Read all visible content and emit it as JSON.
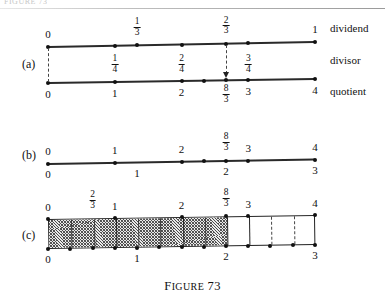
{
  "figure": {
    "running_head": "FIGURE 73",
    "caption_word": "F",
    "caption_word_rest": "IGURE",
    "caption_number": "73",
    "caption_full": "FIGURE 73"
  },
  "panels": {
    "a": {
      "letter": "(a)",
      "row_labels": {
        "dividend": "dividend",
        "divisor": "divisor",
        "quotient": "quotient"
      },
      "dividend_line": {
        "axis_min": 0,
        "axis_max": 1,
        "labels_above": [
          {
            "value": 0,
            "text": "0",
            "type": "integer"
          },
          {
            "value": 0.3333333333,
            "num": "1",
            "den": "3",
            "type": "fraction"
          },
          {
            "value": 0.6666666667,
            "num": "2",
            "den": "3",
            "type": "fraction"
          },
          {
            "value": 1,
            "text": "1",
            "type": "integer"
          }
        ],
        "dots": [
          0,
          0.25,
          0.3333333333,
          0.5,
          0.6666666667,
          0.75,
          1
        ]
      },
      "divisor_labels": [
        {
          "value": 0.25,
          "num": "1",
          "den": "4"
        },
        {
          "value": 0.5,
          "num": "2",
          "den": "4"
        },
        {
          "value": 0.75,
          "num": "3",
          "den": "4"
        }
      ],
      "quotient_line": {
        "axis_min": 0,
        "axis_max": 4,
        "labels_below": [
          {
            "value": 0,
            "text": "0",
            "type": "integer"
          },
          {
            "value": 1,
            "text": "1",
            "type": "integer"
          },
          {
            "value": 2,
            "text": "2",
            "type": "integer"
          },
          {
            "value": 2.66667,
            "num": "8",
            "den": "3",
            "type": "fraction"
          },
          {
            "value": 3,
            "text": "3",
            "type": "integer"
          },
          {
            "value": 4,
            "text": "4",
            "type": "integer"
          }
        ],
        "dots": [
          0,
          1,
          2,
          2.3333333,
          2.6666667,
          3,
          4
        ]
      },
      "projection_lines": [
        {
          "from_value_dividend": 0,
          "to_value_quotient": 0,
          "style": "dashed",
          "arrow": false
        },
        {
          "from_value_dividend": 0.6666666667,
          "to_value_quotient": 2.66667,
          "style": "dashed",
          "arrow": true
        }
      ]
    },
    "b": {
      "letter": "(b)",
      "top_scale": {
        "axis_min": 0,
        "axis_max": 4,
        "labels_above": [
          {
            "value": 0,
            "text": "0",
            "type": "integer"
          },
          {
            "value": 1,
            "text": "1",
            "type": "integer"
          },
          {
            "value": 2,
            "text": "2",
            "type": "integer"
          },
          {
            "value": 2.66667,
            "num": "8",
            "den": "3",
            "type": "fraction"
          },
          {
            "value": 3,
            "text": "3",
            "type": "integer"
          },
          {
            "value": 4,
            "text": "4",
            "type": "integer"
          }
        ]
      },
      "bottom_scale": {
        "axis_min": 0,
        "axis_max": 3,
        "labels_below": [
          {
            "value": 0,
            "text": "0",
            "type": "integer"
          },
          {
            "value": 1,
            "text": "1",
            "type": "integer"
          },
          {
            "value": 2,
            "text": "2",
            "type": "integer"
          },
          {
            "value": 3,
            "text": "3",
            "type": "integer"
          }
        ]
      },
      "dots_top_units": [
        0,
        1,
        2,
        2.3333333,
        2.6666667,
        3,
        4
      ]
    },
    "c": {
      "letter": "(c)",
      "top_scale": {
        "axis_min": 0,
        "axis_max": 4,
        "labels_above": [
          {
            "value": 0,
            "text": "0",
            "type": "integer"
          },
          {
            "value": 0.66667,
            "num": "2",
            "den": "3",
            "type": "fraction"
          },
          {
            "value": 1,
            "text": "1",
            "type": "integer"
          },
          {
            "value": 2,
            "text": "2",
            "type": "integer"
          },
          {
            "value": 2.66667,
            "num": "8",
            "den": "3",
            "type": "fraction"
          },
          {
            "value": 3,
            "text": "3",
            "type": "integer"
          },
          {
            "value": 4,
            "text": "4",
            "type": "integer"
          }
        ]
      },
      "bottom_scale": {
        "axis_min": 0,
        "axis_max": 3,
        "labels_below": [
          {
            "value": 0,
            "text": "0",
            "type": "integer"
          },
          {
            "value": 1,
            "text": "1",
            "type": "integer"
          },
          {
            "value": 2,
            "text": "2",
            "type": "integer"
          },
          {
            "value": 3,
            "text": "3",
            "type": "integer"
          }
        ]
      },
      "bar": {
        "span_min_units": 0,
        "span_max_units": 4,
        "shaded_from_units": 0,
        "shaded_to_units": 2.66667,
        "solid_dividers_units": [
          1,
          2,
          2.66667,
          3
        ],
        "minor_dividers_units": [
          0.33333,
          0.66667,
          1.33333,
          1.66667,
          2.33333
        ],
        "dashed_dividers_units": [
          3.33333,
          3.66667
        ],
        "bottom_dots_units": [
          0,
          0.33333,
          0.66667,
          1,
          1.33333,
          1.66667,
          2,
          2.33333,
          2.66667,
          3,
          3.33333,
          3.66667,
          4
        ],
        "top_dots_units": [
          0,
          1,
          2,
          2.66667,
          3,
          4
        ]
      }
    }
  },
  "colors": {
    "ink": "#1a1a1a",
    "line": "#2a2a2a",
    "hatch": "#4a4a4a",
    "paper": "#ffffff"
  }
}
